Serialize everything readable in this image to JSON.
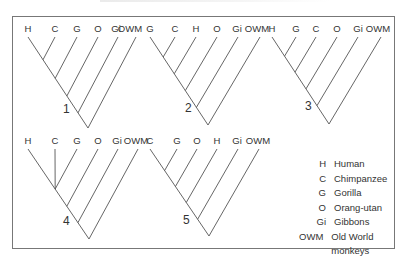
{
  "figure": {
    "type": "cladograms",
    "trees": [
      {
        "number": "1",
        "leaves": [
          "H",
          "C",
          "G",
          "O",
          "Gi",
          "OWM"
        ],
        "label_x": [
          28,
          55,
          77,
          98,
          116,
          130
        ],
        "label_y": 32,
        "root": [
          88,
          128
        ],
        "num_pos": [
          63,
          113
        ],
        "apex_x": [
          28,
          55,
          77,
          98,
          118,
          136
        ]
      },
      {
        "number": "2",
        "leaves": [
          "G",
          "C",
          "H",
          "O",
          "Gi",
          "OWM"
        ],
        "label_x": [
          150,
          175,
          196,
          217,
          237,
          257
        ],
        "label_y": 32,
        "root": [
          208,
          125
        ],
        "num_pos": [
          185,
          112
        ],
        "apex_x": [
          150,
          175,
          196,
          217,
          238,
          260
        ]
      },
      {
        "number": "3",
        "leaves": [
          "H",
          "G",
          "C",
          "O",
          "Gi",
          "OWM"
        ],
        "label_x": [
          272,
          296,
          316,
          337,
          358,
          378
        ],
        "label_y": 32,
        "root": [
          329,
          124
        ],
        "num_pos": [
          305,
          110
        ],
        "apex_x": [
          272,
          296,
          316,
          337,
          358,
          381
        ]
      },
      {
        "number": "4",
        "leaves": [
          "H",
          "C",
          "G",
          "O",
          "Gi",
          "OWM"
        ],
        "label_x": [
          28,
          55,
          77,
          98,
          117,
          136
        ],
        "label_y": 144,
        "root": [
          89,
          239
        ],
        "num_pos": [
          63,
          225
        ],
        "apex_x": [
          28,
          55,
          77,
          98,
          118,
          138
        ],
        "polytomy_first_three": true
      },
      {
        "number": "5",
        "leaves": [
          "C",
          "G",
          "O",
          "H",
          "Gi",
          "OWM"
        ],
        "label_x": [
          150,
          177,
          197,
          217,
          237,
          258
        ],
        "label_y": 144,
        "root": [
          209,
          236
        ],
        "num_pos": [
          183,
          224
        ],
        "apex_x": [
          150,
          177,
          197,
          217,
          238,
          259
        ]
      }
    ],
    "legend": [
      {
        "abbr": "H",
        "name": "Human"
      },
      {
        "abbr": "C",
        "name": "Chimpanzee"
      },
      {
        "abbr": "G",
        "name": "Gorilla"
      },
      {
        "abbr": "O",
        "name": "Orang-utan"
      },
      {
        "abbr": "Gi",
        "name": "Gibbons"
      },
      {
        "abbr": "OWM",
        "name": "Old World monkeys"
      }
    ]
  }
}
